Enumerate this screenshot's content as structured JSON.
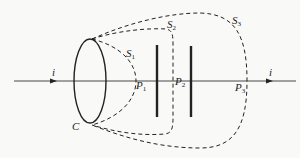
{
  "diagram": {
    "labels": {
      "current_left": "i",
      "current_right": "i",
      "loop": "C",
      "s1": "S",
      "s1_sub": "1",
      "s2": "S",
      "s2_sub": "2",
      "s3": "S",
      "s3_sub": "3",
      "p1": "P",
      "p1_sub": "1",
      "p2": "P",
      "p2_sub": "2",
      "p3": "P",
      "p3_sub": "3"
    },
    "colors": {
      "stroke": "#222222",
      "background": "#f9f9f8"
    }
  }
}
